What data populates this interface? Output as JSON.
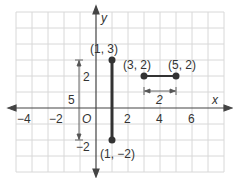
{
  "axes": {
    "x_label": "x",
    "y_label": "y",
    "origin_label": "O",
    "x_ticks": [
      {
        "value": -4,
        "label": "−4"
      },
      {
        "value": -2,
        "label": "−2"
      },
      {
        "value": 2,
        "label": "2"
      },
      {
        "value": 4,
        "label": "4"
      },
      {
        "value": 6,
        "label": "6"
      }
    ],
    "y_ticks": [
      {
        "value": 2,
        "label": "2"
      }
    ]
  },
  "segments": [
    {
      "name": "vertical-segment",
      "from": [
        1,
        3
      ],
      "to": [
        1,
        -2
      ],
      "from_label": "(1, 3)",
      "to_label": "(1, −2)"
    },
    {
      "name": "horizontal-segment",
      "from": [
        3,
        2
      ],
      "to": [
        5,
        2
      ],
      "from_label": "(3, 2)",
      "to_label": "(5, 2)"
    }
  ],
  "annotations": {
    "vertical_length": "5",
    "vertical_top_part": "2",
    "vertical_bottom_part": "−2",
    "horizontal_length": "2"
  },
  "colors": {
    "grid": "#d8d8d8",
    "axis": "#444444",
    "segment": "#333333"
  }
}
